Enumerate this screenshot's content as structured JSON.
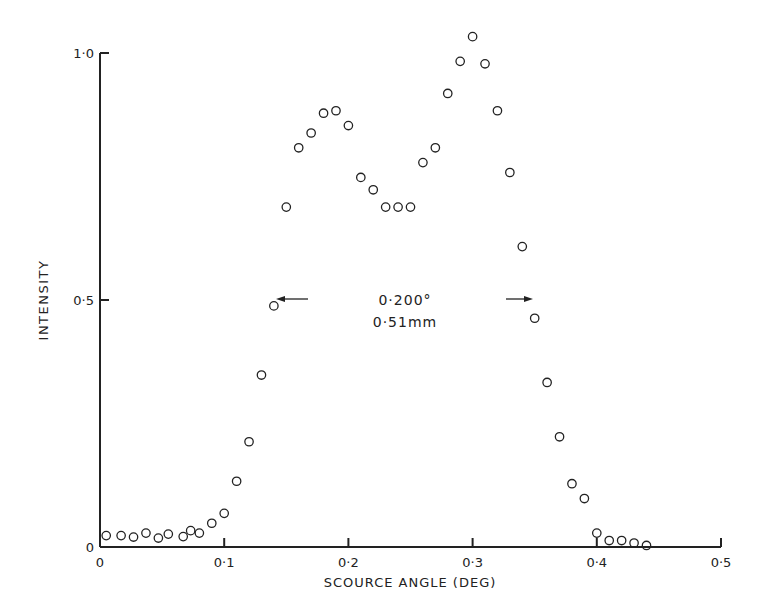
{
  "chart_data": {
    "type": "scatter",
    "title": "",
    "xlabel": "SCOURCE ANGLE (DEG)",
    "ylabel": "INTENSITY",
    "xlim": [
      0,
      0.5
    ],
    "ylim": [
      0,
      1.0
    ],
    "x_ticks": [
      "0",
      "0·1",
      "0·2",
      "0·3",
      "0·4",
      "0·5"
    ],
    "y_ticks": [
      "0",
      "0·5",
      "1·0"
    ],
    "grid": false,
    "annotations": [
      "0·200°",
      "0·51mm"
    ],
    "series": [
      {
        "name": "intensity",
        "marker": "open-circle",
        "points": [
          [
            0.005,
            0.015
          ],
          [
            0.017,
            0.015
          ],
          [
            0.027,
            0.012
          ],
          [
            0.037,
            0.02
          ],
          [
            0.047,
            0.01
          ],
          [
            0.055,
            0.018
          ],
          [
            0.067,
            0.013
          ],
          [
            0.073,
            0.025
          ],
          [
            0.08,
            0.02
          ],
          [
            0.09,
            0.04
          ],
          [
            0.1,
            0.06
          ],
          [
            0.11,
            0.125
          ],
          [
            0.12,
            0.205
          ],
          [
            0.13,
            0.34
          ],
          [
            0.14,
            0.48
          ],
          [
            0.15,
            0.68
          ],
          [
            0.16,
            0.8
          ],
          [
            0.17,
            0.83
          ],
          [
            0.18,
            0.87
          ],
          [
            0.19,
            0.875
          ],
          [
            0.2,
            0.845
          ],
          [
            0.21,
            0.74
          ],
          [
            0.22,
            0.715
          ],
          [
            0.23,
            0.68
          ],
          [
            0.24,
            0.68
          ],
          [
            0.25,
            0.68
          ],
          [
            0.26,
            0.77
          ],
          [
            0.27,
            0.8
          ],
          [
            0.28,
            0.91
          ],
          [
            0.29,
            0.975
          ],
          [
            0.3,
            1.025
          ],
          [
            0.31,
            0.97
          ],
          [
            0.32,
            0.875
          ],
          [
            0.33,
            0.75
          ],
          [
            0.34,
            0.6
          ],
          [
            0.35,
            0.455
          ],
          [
            0.36,
            0.325
          ],
          [
            0.37,
            0.215
          ],
          [
            0.38,
            0.12
          ],
          [
            0.39,
            0.09
          ],
          [
            0.4,
            0.02
          ],
          [
            0.41,
            0.005
          ],
          [
            0.42,
            0.005
          ],
          [
            0.43,
            0.0
          ],
          [
            0.44,
            -0.005
          ]
        ]
      }
    ]
  }
}
